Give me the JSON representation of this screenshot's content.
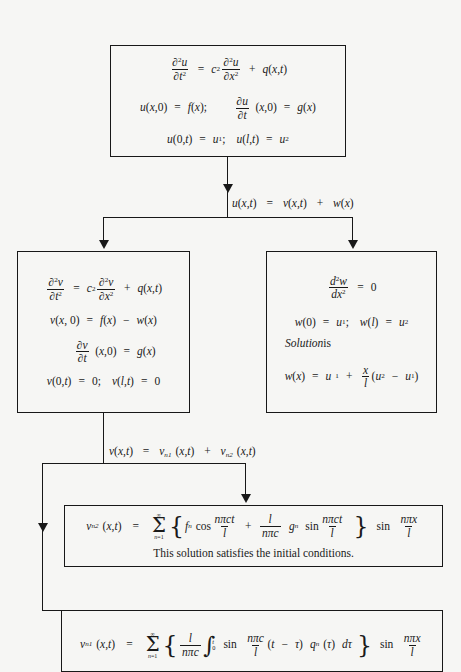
{
  "diagram": {
    "background_color": "#f6f6f4",
    "ink_color": "#181818"
  },
  "boxes": {
    "problem": {
      "name": "original-boundary-value-problem",
      "lines": [
        "∂²u/∂t² = c² ∂²u/∂x² + q(x,t)",
        "u(x,0) = f(x);   ∂u/∂t (x,0) = g(x)",
        "u(0,t) = u₁;   u(l,t) = u₂"
      ]
    },
    "v_problem": {
      "name": "v-subproblem",
      "lines": [
        "∂²v/∂t² = c² ∂²v/∂x² + q(x,t)",
        "v(x, 0) = f(x) − w(x)",
        "∂v/∂t (x,0) = g(x)",
        "v(0,t) = 0;   v(l,t) = 0"
      ]
    },
    "w_problem": {
      "name": "w-subproblem",
      "lines": [
        "d²w/dx² = 0",
        "w(0) = u₁;   w(l) = u₂",
        "Solution is",
        "w(x) = u₁ + (x/l)(u₂ − u₁)"
      ],
      "solution_label": "Solution",
      "solution_label_tail": " is"
    },
    "vn2": {
      "name": "vn2-series-solution",
      "formula": "v_n2 (x,t) = Σ_{n=1}^{∞} { f_n cos(nπct/l) + (l/nπc) g_n sin(nπct/l) } sin(nπx/l)",
      "note": "This solution satisfies the initial conditions."
    },
    "vn1": {
      "name": "vn1-series-solution",
      "formula": "v_n1 (x,t) = Σ_{n=1}^{∞} { (l/nπc) ∫₀ᵗ sin(nπc/l)(t − τ) q_n (τ) dτ } sin(nπx/l)"
    }
  },
  "connector_labels": {
    "split_u": "u(x,t) = v(x,t) + w(x)",
    "split_v": "v(x,t) = v_n1 (x,t) + v_n2 (x,t)"
  },
  "symbols": {
    "u": "u",
    "v": "v",
    "w": "w",
    "x": "x",
    "t": "t",
    "c": "c",
    "l": "l",
    "q": "q",
    "f": "f",
    "g": "g",
    "n": "n",
    "tau": "τ",
    "pi": "π",
    "infinity": "∞",
    "sigma": "Σ",
    "partial": "∂",
    "d": "d",
    "zero": "0",
    "one": "1",
    "two": "2",
    "eq": "=",
    "plus": "+",
    "minus": "−",
    "semicolon": ";",
    "comma": ",",
    "sin": "sin",
    "cos": "cos",
    "lparen": "(",
    "rparen": ")",
    "n_eq_1": "n=1"
  }
}
